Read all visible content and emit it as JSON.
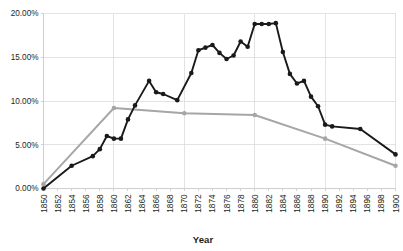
{
  "chart_data": {
    "type": "line",
    "title": "",
    "xlabel": "Year",
    "ylabel": "",
    "grid": true,
    "legend": "none",
    "xlim": [
      1850,
      1900
    ],
    "ylim": [
      0,
      20
    ],
    "yticks": [
      0,
      5,
      10,
      15,
      20
    ],
    "ytick_labels": [
      "0.00%",
      "5.00%",
      "10.00%",
      "15.00%",
      "20.00%"
    ],
    "xticks": [
      1850,
      1852,
      1854,
      1856,
      1858,
      1860,
      1862,
      1864,
      1866,
      1868,
      1870,
      1872,
      1874,
      1876,
      1878,
      1880,
      1882,
      1884,
      1886,
      1888,
      1890,
      1892,
      1894,
      1896,
      1898,
      1900
    ],
    "xtick_labels": [
      "1850",
      "1852",
      "1854",
      "1856",
      "1858",
      "1860",
      "1862",
      "1864",
      "1866",
      "1868",
      "1870",
      "1872",
      "1874",
      "1876",
      "1878",
      "1880",
      "1882",
      "1884",
      "1886",
      "1888",
      "1890",
      "1892",
      "1894",
      "1896",
      "1898",
      "1900"
    ],
    "xgridlines": [
      1850,
      1860,
      1870,
      1880,
      1890,
      1900
    ],
    "series": [
      {
        "name": "dark-series",
        "color": "#1a1a1a",
        "marker": "circle",
        "x": [
          1850,
          1854,
          1857,
          1858,
          1859,
          1860,
          1861,
          1862,
          1863,
          1865,
          1866,
          1867,
          1869,
          1871,
          1872,
          1873,
          1874,
          1875,
          1876,
          1877,
          1878,
          1879,
          1880,
          1881,
          1882,
          1883,
          1884,
          1885,
          1886,
          1887,
          1888,
          1889,
          1890,
          1891,
          1895,
          1900
        ],
        "values": [
          0.0,
          2.6,
          3.7,
          4.5,
          6.0,
          5.7,
          5.7,
          7.9,
          9.5,
          12.3,
          11.0,
          10.8,
          10.1,
          13.2,
          15.8,
          16.1,
          16.4,
          15.5,
          14.8,
          15.2,
          16.8,
          16.2,
          18.8,
          18.8,
          18.8,
          18.9,
          15.6,
          13.1,
          12.0,
          12.3,
          10.5,
          9.4,
          7.3,
          7.1,
          6.8,
          3.9
        ]
      },
      {
        "name": "gray-series",
        "color": "#a6a6a6",
        "marker": "circle",
        "x": [
          1850,
          1860,
          1870,
          1880,
          1890,
          1900
        ],
        "values": [
          0.5,
          9.2,
          8.6,
          8.4,
          5.7,
          2.6
        ]
      }
    ]
  }
}
